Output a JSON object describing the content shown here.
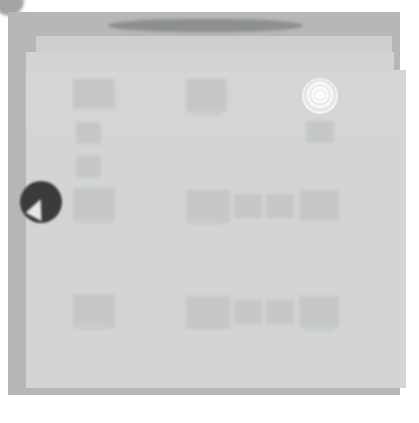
{
  "screenshot": {
    "width": 419,
    "height": 423,
    "background": "#ffffff",
    "description": "Heavily blurred / obscured application window screenshot"
  },
  "colors": {
    "page_background": "#ffffff",
    "window_frame": "#b5b7b7",
    "panel_light": "#d4d6d6",
    "panel_mid": "#cdcfcf",
    "content_block": "#c4c6c6",
    "titlebar_dark": "#8b8d8d",
    "glow_white": "#ffffff",
    "cursor_disc_dark": "#37383a",
    "cursor_arrow_light": "#e9e7e2"
  },
  "window": {
    "frame": {
      "x": 8,
      "y": 12,
      "w": 392,
      "h": 383
    },
    "titlebar": {
      "x": 108,
      "y": 19,
      "w": 195,
      "h": 13
    }
  },
  "markers": {
    "corner_dot": {
      "name": "corner-dot",
      "x": -6,
      "y": -14,
      "d": 30
    },
    "glow": {
      "name": "radial-glow-indicator",
      "x": 302,
      "y": 78,
      "d": 36
    },
    "cursor": {
      "name": "cursor-marker",
      "x": 20,
      "y": 181,
      "d": 42
    }
  },
  "content_blocks": [
    {
      "name": "block-col1-row1",
      "x": 73,
      "y": 79,
      "w": 42,
      "h": 30
    },
    {
      "name": "block-col1-row2",
      "x": 76,
      "y": 122,
      "w": 25,
      "h": 22
    },
    {
      "name": "block-col1-row3",
      "x": 76,
      "y": 155,
      "w": 25,
      "h": 22
    },
    {
      "name": "block-col1-row4",
      "x": 73,
      "y": 188,
      "w": 42,
      "h": 34
    },
    {
      "name": "block-col1-row4-tab",
      "x": 78,
      "y": 216,
      "w": 32,
      "h": 7,
      "sub": true
    },
    {
      "name": "block-col1-row5",
      "x": 73,
      "y": 294,
      "w": 42,
      "h": 34
    },
    {
      "name": "block-col1-row5-tab",
      "x": 78,
      "y": 322,
      "w": 32,
      "h": 7,
      "sub": true
    },
    {
      "name": "block-col2-row1",
      "x": 186,
      "y": 79,
      "w": 41,
      "h": 33
    },
    {
      "name": "block-col2-row1-tab",
      "x": 192,
      "y": 110,
      "w": 29,
      "h": 6,
      "sub": true
    },
    {
      "name": "block-col2-row4",
      "x": 186,
      "y": 190,
      "w": 44,
      "h": 33
    },
    {
      "name": "block-col2-row4-tab",
      "x": 192,
      "y": 218,
      "w": 29,
      "h": 6,
      "sub": true
    },
    {
      "name": "block-col2-row5",
      "x": 186,
      "y": 296,
      "w": 44,
      "h": 33
    },
    {
      "name": "block-col3-row4",
      "x": 234,
      "y": 194,
      "w": 28,
      "h": 24
    },
    {
      "name": "block-col4-row4",
      "x": 266,
      "y": 194,
      "w": 28,
      "h": 24
    },
    {
      "name": "block-col5-row4",
      "x": 299,
      "y": 190,
      "w": 40,
      "h": 31
    },
    {
      "name": "block-col3-row5",
      "x": 234,
      "y": 300,
      "w": 28,
      "h": 24
    },
    {
      "name": "block-col4-row5",
      "x": 266,
      "y": 300,
      "w": 28,
      "h": 24
    },
    {
      "name": "block-col5-row5",
      "x": 299,
      "y": 296,
      "w": 40,
      "h": 31
    },
    {
      "name": "block-col5-row5-tab",
      "x": 305,
      "y": 325,
      "w": 29,
      "h": 6,
      "sub": true
    },
    {
      "name": "block-col6-row2",
      "x": 306,
      "y": 121,
      "w": 28,
      "h": 22
    }
  ]
}
